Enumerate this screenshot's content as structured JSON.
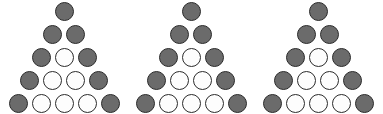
{
  "figure": {
    "type": "dot-triangle-series",
    "background_color": "#ffffff",
    "repetitions": 3,
    "dot_diameter_px": 19,
    "row_pitch_px": 23,
    "column_pitch_px": 23,
    "styles": {
      "filled": {
        "name": "filled-dot",
        "fill_color": "#6b6b6b",
        "outline_color": "#2b2b2b"
      },
      "open": {
        "name": "open-dot",
        "fill_color": "#fdfdfd",
        "outline_color": "#2b2b2b"
      }
    },
    "triangles": [
      {
        "index": 1,
        "label": "triangle-1",
        "left_px": 0,
        "row_count": 5,
        "total_dots": 15,
        "filled_count": 9,
        "open_count": 6,
        "rows": [
          {
            "row": 1,
            "top_px": 0,
            "count": 1,
            "dots": [
              "filled"
            ]
          },
          {
            "row": 2,
            "top_px": 23,
            "count": 2,
            "dots": [
              "filled",
              "filled"
            ]
          },
          {
            "row": 3,
            "top_px": 46,
            "count": 3,
            "dots": [
              "filled",
              "open",
              "filled"
            ]
          },
          {
            "row": 4,
            "top_px": 69,
            "count": 4,
            "dots": [
              "filled",
              "open",
              "open",
              "filled"
            ]
          },
          {
            "row": 5,
            "top_px": 92,
            "count": 5,
            "dots": [
              "filled",
              "open",
              "open",
              "open",
              "filled"
            ]
          }
        ]
      },
      {
        "index": 2,
        "label": "triangle-2",
        "left_px": 127,
        "row_count": 5,
        "total_dots": 15,
        "filled_count": 9,
        "open_count": 6,
        "rows": [
          {
            "row": 1,
            "top_px": 0,
            "count": 1,
            "dots": [
              "filled"
            ]
          },
          {
            "row": 2,
            "top_px": 23,
            "count": 2,
            "dots": [
              "filled",
              "filled"
            ]
          },
          {
            "row": 3,
            "top_px": 46,
            "count": 3,
            "dots": [
              "filled",
              "open",
              "filled"
            ]
          },
          {
            "row": 4,
            "top_px": 69,
            "count": 4,
            "dots": [
              "filled",
              "open",
              "open",
              "filled"
            ]
          },
          {
            "row": 5,
            "top_px": 92,
            "count": 5,
            "dots": [
              "filled",
              "open",
              "open",
              "open",
              "filled"
            ]
          }
        ]
      },
      {
        "index": 3,
        "label": "triangle-3",
        "left_px": 254,
        "row_count": 5,
        "total_dots": 15,
        "filled_count": 9,
        "open_count": 6,
        "rows": [
          {
            "row": 1,
            "top_px": 0,
            "count": 1,
            "dots": [
              "filled"
            ]
          },
          {
            "row": 2,
            "top_px": 23,
            "count": 2,
            "dots": [
              "filled",
              "filled"
            ]
          },
          {
            "row": 3,
            "top_px": 46,
            "count": 3,
            "dots": [
              "filled",
              "open",
              "filled"
            ]
          },
          {
            "row": 4,
            "top_px": 69,
            "count": 4,
            "dots": [
              "filled",
              "open",
              "open",
              "filled"
            ]
          },
          {
            "row": 5,
            "top_px": 92,
            "count": 5,
            "dots": [
              "filled",
              "open",
              "open",
              "open",
              "filled"
            ]
          }
        ]
      }
    ]
  }
}
